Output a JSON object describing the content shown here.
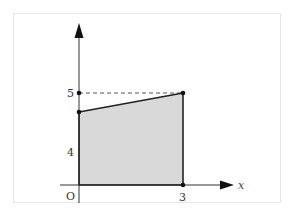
{
  "diagram": {
    "type": "shaded-region-graph",
    "axes": {
      "x_label": "x",
      "y_label": "",
      "origin_label": "O"
    },
    "tick_labels": {
      "x": [
        "3"
      ],
      "y": [
        "5",
        "4"
      ]
    },
    "region": {
      "description": "Trapezoid under a line segment from x=0 to x=3",
      "vertices": [
        {
          "name": "origin",
          "x": 0,
          "y": 0
        },
        {
          "name": "left-top",
          "x": 0,
          "y": 4.7
        },
        {
          "name": "right-top",
          "x": 3,
          "y": 5
        },
        {
          "name": "right-bottom",
          "x": 3,
          "y": 0
        }
      ],
      "fill_color": "#d9d9d9",
      "edge_color": "#222222"
    },
    "guide_line": {
      "style": "dashed",
      "from": {
        "x": 0,
        "y": 5
      },
      "to": {
        "x": 3,
        "y": 5
      }
    },
    "marked_points": [
      {
        "x": 0,
        "y": 5
      },
      {
        "x": 0,
        "y": 4.7
      },
      {
        "x": 3,
        "y": 5
      },
      {
        "x": 3,
        "y": 0
      }
    ]
  }
}
